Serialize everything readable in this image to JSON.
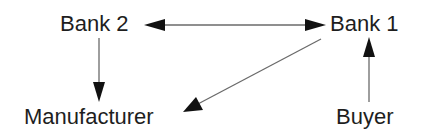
{
  "diagram": {
    "type": "flow",
    "nodes": [
      {
        "id": "bank2",
        "label": "Bank 2"
      },
      {
        "id": "bank1",
        "label": "Bank 1"
      },
      {
        "id": "manufacturer",
        "label": "Manufacturer"
      },
      {
        "id": "buyer",
        "label": "Buyer"
      }
    ],
    "edges": [
      {
        "from": "bank2",
        "to": "bank1",
        "direction": "bidirectional"
      },
      {
        "from": "bank2",
        "to": "manufacturer",
        "direction": "forward"
      },
      {
        "from": "bank1",
        "to": "manufacturer",
        "direction": "forward"
      },
      {
        "from": "buyer",
        "to": "bank1",
        "direction": "forward"
      }
    ],
    "colors": {
      "text": "#1e1e1e",
      "line": "#6a6a6a",
      "arrowhead": "#111111",
      "background": "#ffffff"
    }
  }
}
